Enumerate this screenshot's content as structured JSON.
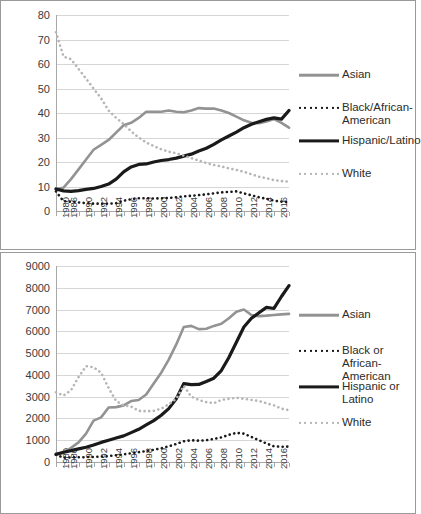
{
  "chart_data": [
    {
      "id": "top",
      "type": "line",
      "title": "",
      "xlabel": "",
      "ylabel": "",
      "ylim": [
        0,
        80
      ],
      "yticks": [
        0,
        10,
        20,
        30,
        40,
        50,
        60,
        70,
        80
      ],
      "grid": true,
      "legend_position": "right",
      "x": [
        1980,
        1986,
        1987,
        1988,
        1989,
        1990,
        1991,
        1992,
        1993,
        1994,
        1995,
        1996,
        1997,
        1998,
        1999,
        2000,
        2001,
        2002,
        2003,
        2004,
        2005,
        2006,
        2007,
        2008,
        2009,
        2010,
        2011,
        2012,
        2013,
        2014,
        2015,
        2016
      ],
      "tick_labels": [
        "1980",
        "1986",
        "",
        "1990",
        "",
        "1992",
        "",
        "1994",
        "",
        "1996",
        "",
        "1998",
        "",
        "2000",
        "",
        "2002",
        "",
        "2004",
        "",
        "2006",
        "",
        "2008",
        "",
        "2010",
        "",
        "2012",
        "",
        "2014",
        "",
        "2016",
        "",
        ""
      ],
      "labeled_ticks": [
        "1980",
        "1986",
        "1990",
        "1992",
        "1994",
        "1996",
        "1998",
        "2000",
        "2002",
        "2004",
        "2006",
        "2008",
        "2010",
        "2012",
        "2014",
        "2016"
      ],
      "series": [
        {
          "name": "Asian",
          "style": "solid",
          "color": "#939393",
          "width": 2.6,
          "values": [
            9,
            9.5,
            13,
            17,
            21,
            25,
            27,
            29,
            32,
            35,
            36,
            38,
            40.5,
            40.5,
            40.5,
            41,
            40.5,
            40.3,
            41,
            42,
            41.8,
            41.8,
            41,
            40,
            38.5,
            37,
            36,
            35.8,
            36.5,
            37.5,
            36,
            34
          ]
        },
        {
          "name": "Black/African-\nAmerican",
          "style": "dotted",
          "color": "#1a1a1a",
          "width": 2.6,
          "values": [
            8,
            4,
            3.8,
            3.5,
            3.2,
            3,
            3,
            3,
            3.2,
            4.2,
            4.8,
            5.2,
            5.2,
            5.1,
            5.2,
            5.3,
            5.6,
            6,
            6.2,
            6.5,
            6.8,
            7.2,
            7.6,
            7.8,
            8,
            7.2,
            6.4,
            5.6,
            5,
            4.2,
            3.8,
            3.6
          ]
        },
        {
          "name": "Hispanic/Latino",
          "style": "solid",
          "color": "#1a1a1a",
          "width": 3.2,
          "values": [
            9,
            8.2,
            8,
            8.3,
            8.8,
            9.2,
            10,
            11,
            13,
            16,
            18,
            19,
            19.2,
            20,
            20.6,
            21,
            21.6,
            22.4,
            23.2,
            24.5,
            25.6,
            27.2,
            29,
            30.6,
            32.2,
            34,
            35.4,
            36.4,
            37.4,
            38,
            37.5,
            41
          ]
        },
        {
          "name": "White",
          "style": "dotted",
          "color": "#b6b6b6",
          "width": 2.6,
          "values": [
            73,
            63,
            62,
            58,
            54,
            50,
            46,
            41,
            38,
            35.5,
            32.5,
            30,
            28,
            26.5,
            25.2,
            24.2,
            23.6,
            22.6,
            21.6,
            20.6,
            19.6,
            18.8,
            18.2,
            17.4,
            16.8,
            16,
            15,
            14,
            13.4,
            12.6,
            12.2,
            12
          ]
        }
      ]
    },
    {
      "id": "bottom",
      "type": "line",
      "title": "",
      "xlabel": "",
      "ylabel": "",
      "ylim": [
        0,
        9000
      ],
      "yticks": [
        0,
        1000,
        2000,
        3000,
        4000,
        5000,
        6000,
        7000,
        8000,
        9000
      ],
      "grid": true,
      "legend_position": "right",
      "x": [
        1980,
        1986,
        1987,
        1988,
        1989,
        1990,
        1991,
        1992,
        1993,
        1994,
        1995,
        1996,
        1997,
        1998,
        1999,
        2000,
        2001,
        2002,
        2003,
        2004,
        2005,
        2006,
        2007,
        2008,
        2009,
        2010,
        2011,
        2012,
        2013,
        2014,
        2015,
        2016
      ],
      "tick_labels": [
        "1980",
        "1986",
        "",
        "1990",
        "",
        "1992",
        "",
        "1994",
        "",
        "1996",
        "",
        "1998",
        "",
        "2000",
        "",
        "2002",
        "",
        "2004",
        "",
        "2006",
        "",
        "2008",
        "",
        "2010",
        "",
        "2012",
        "",
        "2014",
        "",
        "2016",
        "",
        ""
      ],
      "labeled_ticks": [
        "1980",
        "1986",
        "1990",
        "1992",
        "1994",
        "1996",
        "1998",
        "2000",
        "2002",
        "2004",
        "2006",
        "2008",
        "2010",
        "2012",
        "2014",
        "2016"
      ],
      "series": [
        {
          "name": "Asian",
          "style": "solid",
          "color": "#939393",
          "width": 2.6,
          "values": [
            380,
            420,
            650,
            900,
            1300,
            1900,
            2050,
            2500,
            2520,
            2600,
            2800,
            2850,
            3100,
            3600,
            4100,
            4700,
            5400,
            6200,
            6250,
            6100,
            6120,
            6250,
            6350,
            6600,
            6900,
            7000,
            6750,
            6700,
            6720,
            6750,
            6780,
            6800
          ]
        },
        {
          "name": "Black or African-\nAmerican",
          "style": "dotted",
          "color": "#1a1a1a",
          "width": 2.6,
          "values": [
            330,
            200,
            210,
            215,
            225,
            230,
            250,
            270,
            310,
            350,
            400,
            450,
            500,
            560,
            630,
            720,
            830,
            950,
            1000,
            980,
            1000,
            1060,
            1130,
            1250,
            1340,
            1300,
            1150,
            1000,
            850,
            720,
            700,
            710
          ]
        },
        {
          "name": "Hispanic or Latino",
          "style": "solid",
          "color": "#1a1a1a",
          "width": 3.2,
          "values": [
            350,
            450,
            520,
            600,
            680,
            780,
            900,
            1000,
            1100,
            1200,
            1350,
            1500,
            1700,
            1900,
            2150,
            2450,
            2900,
            3600,
            3550,
            3560,
            3700,
            3850,
            4200,
            4800,
            5500,
            6200,
            6600,
            6850,
            7100,
            7050,
            7600,
            8100
          ]
        },
        {
          "name": "White",
          "style": "dotted",
          "color": "#b6b6b6",
          "width": 2.6,
          "values": [
            3200,
            3050,
            3300,
            3900,
            4400,
            4350,
            4100,
            3400,
            2800,
            2600,
            2550,
            2350,
            2330,
            2350,
            2450,
            2650,
            2900,
            3500,
            3000,
            2850,
            2750,
            2700,
            2850,
            2900,
            2950,
            2900,
            2850,
            2800,
            2700,
            2600,
            2450,
            2380
          ]
        }
      ]
    }
  ],
  "panels": {
    "top": {
      "legend": [
        {
          "label": "Asian"
        },
        {
          "label": "Black/African-\nAmerican"
        },
        {
          "label": "Hispanic/Latino"
        },
        {
          "label": "White"
        }
      ]
    },
    "bottom": {
      "legend": [
        {
          "label": "Asian"
        },
        {
          "label": "Black or African-\nAmerican"
        },
        {
          "label": "Hispanic or Latino"
        },
        {
          "label": "White"
        }
      ]
    }
  },
  "colors": {
    "asian": "#939393",
    "black_african_american": "#1a1a1a",
    "hispanic_latino": "#1a1a1a",
    "white": "#b6b6b6",
    "gridline": "#d6d6d6",
    "axis": "#a8a8a8",
    "text": "#3a3a3a",
    "border": "#9a9a9a"
  }
}
